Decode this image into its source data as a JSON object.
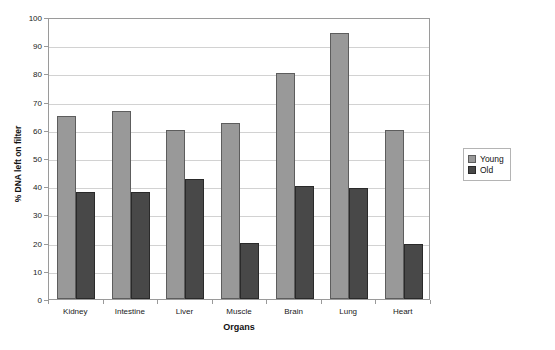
{
  "chart_data": {
    "type": "bar",
    "title": "",
    "xlabel": "Organs",
    "ylabel": "% DNA left on filter",
    "categories": [
      "Kidney",
      "Intestine",
      "Liver",
      "Muscle",
      "Brain",
      "Lung",
      "Heart"
    ],
    "series": [
      {
        "name": "Young",
        "color": "#999999",
        "values": [
          65,
          66.5,
          60,
          62.5,
          80,
          94.5,
          60
        ]
      },
      {
        "name": "Old",
        "color": "#484848",
        "values": [
          38,
          38,
          42.5,
          20,
          40,
          39.5,
          19.5
        ]
      }
    ],
    "ylim": [
      0,
      100
    ],
    "yticks": [
      0,
      10,
      20,
      30,
      40,
      50,
      60,
      70,
      80,
      90,
      100
    ],
    "ytick_labels": [
      "0",
      "10",
      "20",
      "30",
      "40",
      "50",
      "60",
      "70",
      "80",
      "90",
      "100"
    ],
    "grid": true,
    "grid_axis": "y",
    "legend_position": "right",
    "bar_group_count": 7,
    "bars_per_group": 2
  }
}
